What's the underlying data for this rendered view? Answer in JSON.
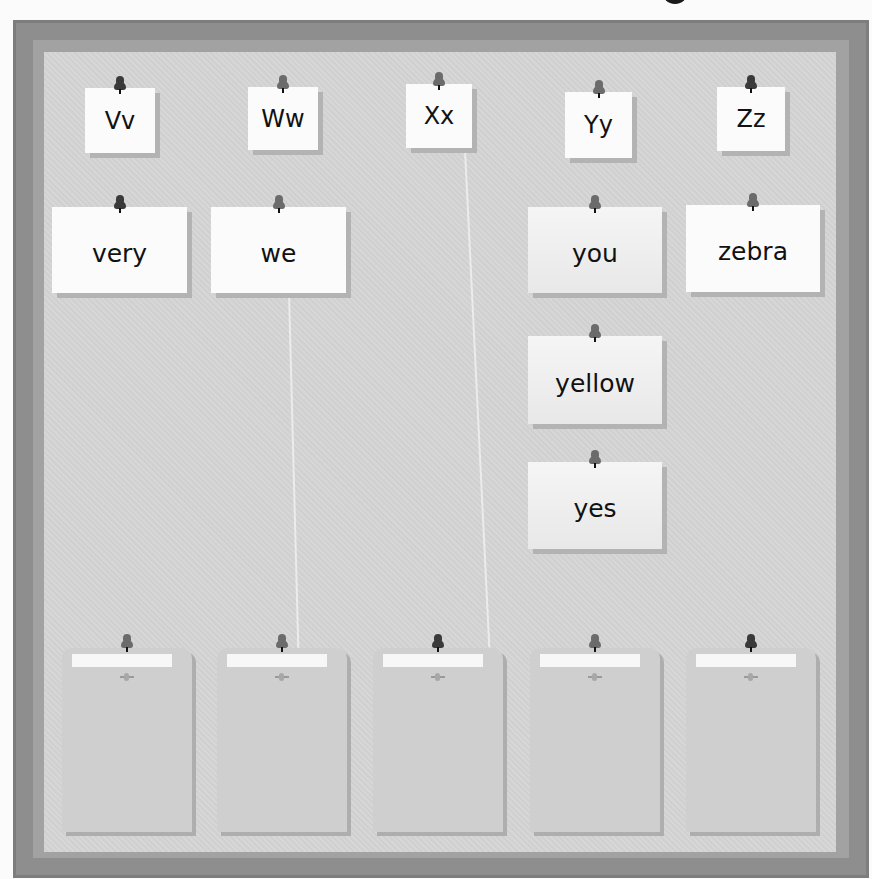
{
  "activity": {
    "type": "alphabet word sort board",
    "top_clipped_title_fragment": ""
  },
  "header_cards": [
    {
      "id": "Vv",
      "label": "Vv",
      "x": 85,
      "y": 88,
      "w": 70,
      "h": 65,
      "pin": "dark"
    },
    {
      "id": "Ww",
      "label": "Ww",
      "x": 248,
      "y": 87,
      "w": 70,
      "h": 63,
      "pin": "light"
    },
    {
      "id": "Xx",
      "label": "Xx",
      "x": 406,
      "y": 84,
      "w": 66,
      "h": 64,
      "pin": "light"
    },
    {
      "id": "Yy",
      "label": "Yy",
      "x": 565,
      "y": 92,
      "w": 67,
      "h": 66,
      "pin": "light"
    },
    {
      "id": "Zz",
      "label": "Zz",
      "x": 717,
      "y": 87,
      "w": 68,
      "h": 64,
      "pin": "dark"
    }
  ],
  "word_cards": [
    {
      "word": "very",
      "x": 52,
      "y": 207,
      "w": 135,
      "h": 86,
      "pin": "dark",
      "shaded": false
    },
    {
      "word": "we",
      "x": 211,
      "y": 207,
      "w": 135,
      "h": 86,
      "pin": "light",
      "shaded": false
    },
    {
      "word": "you",
      "x": 528,
      "y": 207,
      "w": 134,
      "h": 86,
      "pin": "light",
      "shaded": true
    },
    {
      "word": "zebra",
      "x": 686,
      "y": 205,
      "w": 134,
      "h": 87,
      "pin": "light",
      "shaded": false
    },
    {
      "word": "yellow",
      "x": 528,
      "y": 336,
      "w": 134,
      "h": 88,
      "pin": "light",
      "shaded": true
    },
    {
      "word": "yes",
      "x": 528,
      "y": 462,
      "w": 134,
      "h": 87,
      "pin": "light",
      "shaded": true
    }
  ],
  "pockets": [
    {
      "letter": "Vv",
      "x": 62,
      "label": ""
    },
    {
      "letter": "Ww",
      "x": 217,
      "label": ""
    },
    {
      "letter": "Xx",
      "x": 373,
      "label": ""
    },
    {
      "letter": "Yy",
      "x": 530,
      "label": ""
    },
    {
      "letter": "Zz",
      "x": 686,
      "label": ""
    }
  ],
  "colors": {
    "frame_outer": "#8e8e8e",
    "frame_inner": "#a2a2a2",
    "board": "#d4d4d4",
    "card": "#fbfbfb",
    "card_shadow": "#b3b3b3",
    "pin_dark": "#3a3a3a",
    "pin_light": "#6b6b6b",
    "text": "#111111"
  }
}
